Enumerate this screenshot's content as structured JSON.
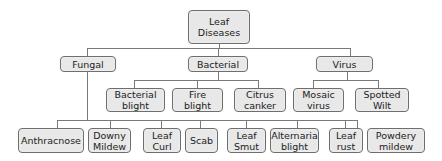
{
  "diagram": {
    "type": "tree",
    "root": {
      "label": "Leaf\nDiseases"
    },
    "categories": [
      {
        "label": "Fungal"
      },
      {
        "label": "Bacterial"
      },
      {
        "label": "Virus"
      }
    ],
    "bacterial_children": [
      {
        "label": "Bacterial\nblight"
      },
      {
        "label": "Fire\nblight"
      },
      {
        "label": "Citrus\ncanker"
      }
    ],
    "virus_children": [
      {
        "label": "Mosaic\nvirus"
      },
      {
        "label": "Spotted\nWilt"
      }
    ],
    "fungal_children": [
      {
        "label": "Anthracnose"
      },
      {
        "label": "Downy\nMildew"
      },
      {
        "label": "Leaf\nCurl"
      },
      {
        "label": "Scab"
      },
      {
        "label": "Leaf\nSmut"
      },
      {
        "label": "Alternaria\nblight"
      },
      {
        "label": "Leaf\nrust"
      },
      {
        "label": "Powdery\nmildew"
      }
    ]
  }
}
